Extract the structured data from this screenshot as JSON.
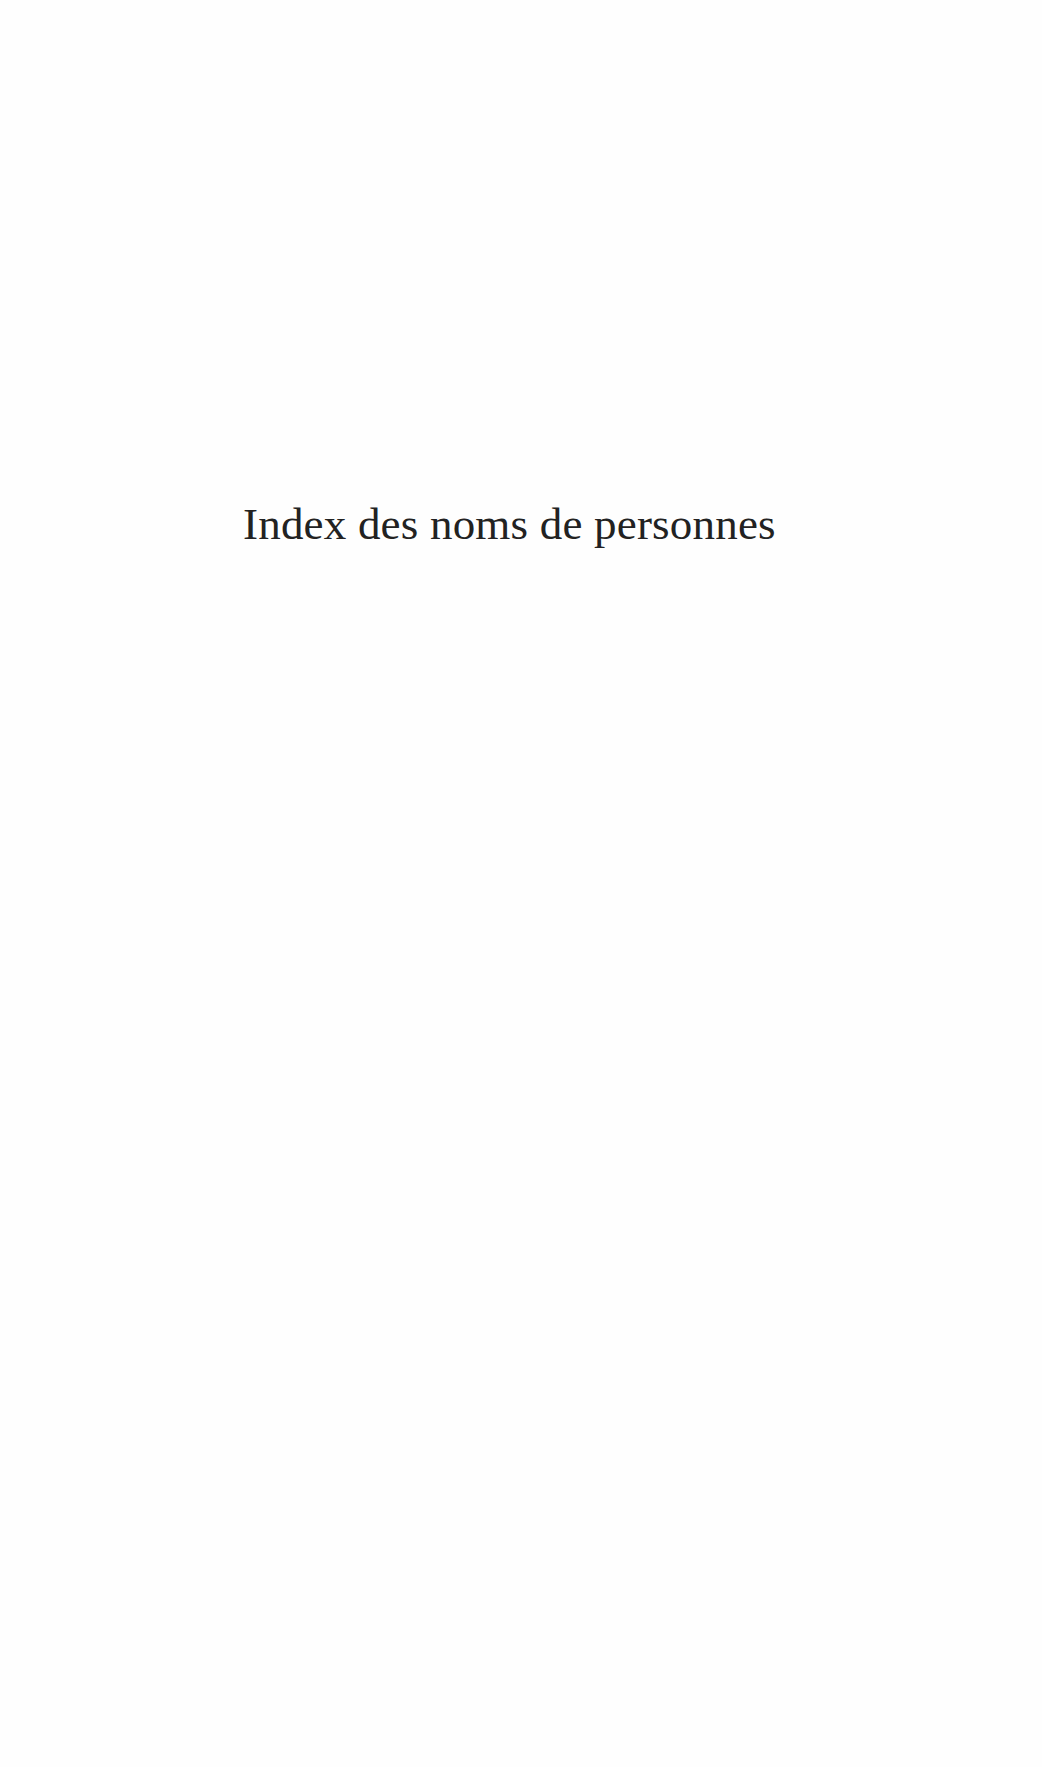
{
  "page": {
    "title": "Index des noms de personnes",
    "text_color": "#222222",
    "background_color": "#fefefe"
  }
}
